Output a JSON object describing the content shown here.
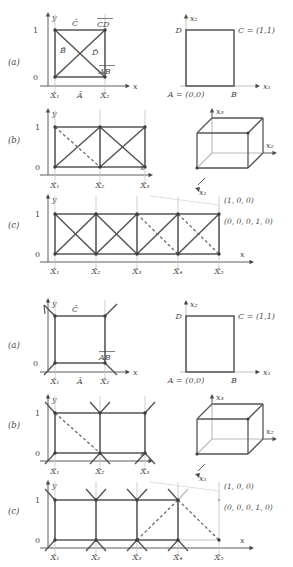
{
  "figure": {
    "colors": {
      "edge": "#555555",
      "grid": "#b9b9b9",
      "text": "#4a4a4a",
      "dash": "#6a6a6a",
      "node": "#3d3d3d"
    },
    "variants": [
      {
        "name": "full",
        "panels": [
          {
            "tag": "(a)",
            "left_plot": {
              "axis_x_label": "x",
              "axis_y_label": "y",
              "y_ticks": [
                "0",
                "1"
              ],
              "node_labels": [
                "X̂₁",
                "X̂₂"
              ],
              "edge_labels": [
                "Ā",
                "B̂",
                "Ĉ",
                "D̂",
                "AB",
                "CD"
              ],
              "bottom_mid_label": "Ā"
            },
            "right_plot": {
              "axis_x_label": "x₁",
              "axis_y_label": "x₂",
              "corner_labels": [
                "A = (0,0)",
                "B",
                "C = (1,1)",
                "D"
              ]
            }
          },
          {
            "tag": "(b)",
            "left_plot": {
              "axis_x_label": "x",
              "axis_y_label": "y",
              "y_ticks": [
                "0",
                "1"
              ],
              "node_labels": [
                "X̂₁",
                "X̂₂",
                "X̂₃"
              ]
            },
            "right_plot": {
              "axis_labels": [
                "x₁",
                "x₂",
                "x₃"
              ],
              "shape": "cube"
            }
          },
          {
            "tag": "(c)",
            "left_plot": {
              "axis_x_label": "x",
              "axis_y_label": "y",
              "y_ticks": [
                "0",
                "1"
              ],
              "node_labels": [
                "X̂₁",
                "X̂₂",
                "X̂₃",
                "X̂₄",
                "X̂₅"
              ]
            },
            "annotations": [
              "(1, 0, 0)",
              "(0, 0, 0, 1, 0)"
            ]
          }
        ]
      },
      {
        "name": "partial",
        "panels": [
          {
            "tag": "(a)",
            "left_plot": {
              "axis_x_label": "x",
              "axis_y_label": "y",
              "y_ticks": [
                "0",
                "1"
              ],
              "node_labels": [
                "X̂₁",
                "X̂₂"
              ],
              "edge_labels": [
                "Ā",
                "Ĉ",
                "AB"
              ],
              "bottom_mid_label": "Ā"
            },
            "right_plot": {
              "axis_x_label": "x₁",
              "axis_y_label": "x₂",
              "corner_labels": [
                "A = (0,0)",
                "B",
                "C = (1,1)",
                "D"
              ]
            }
          },
          {
            "tag": "(b)",
            "left_plot": {
              "axis_x_label": "x",
              "axis_y_label": "y",
              "y_ticks": [
                "0",
                "1"
              ],
              "node_labels": [
                "X̂₁",
                "X̂₂",
                "X̂₃"
              ]
            },
            "right_plot": {
              "axis_labels": [
                "x₁",
                "x₂",
                "x₃"
              ],
              "shape": "cube"
            }
          },
          {
            "tag": "(c)",
            "left_plot": {
              "axis_x_label": "x",
              "axis_y_label": "y",
              "y_ticks": [
                "0",
                "1"
              ],
              "node_labels": [
                "X̂₁",
                "X̂₂",
                "X̂₃",
                "X̂₄",
                "X̂₅"
              ]
            },
            "annotations": [
              "(1, 0, 0)",
              "(0, 0, 0, 1, 0)"
            ]
          }
        ]
      }
    ]
  }
}
